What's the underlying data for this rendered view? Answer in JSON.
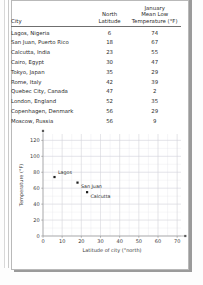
{
  "table": {
    "columns": [
      {
        "key": "city",
        "lines": [
          "City"
        ]
      },
      {
        "key": "lat",
        "lines": [
          "North",
          "Latitude"
        ]
      },
      {
        "key": "temp",
        "lines": [
          "January",
          "Mean Low",
          "Temperature (°F)"
        ]
      }
    ],
    "header": {
      "city": "City",
      "lat_line1": "North",
      "lat_line2": "Latitude",
      "temp_line1": "January",
      "temp_line2": "Mean Low",
      "temp_line3": "Temperature (°F)"
    },
    "rows": [
      {
        "city": "Lagos, Nigeria",
        "lat": "6",
        "temp": "74"
      },
      {
        "city": "San Juan, Puerto Rico",
        "lat": "18",
        "temp": "67"
      },
      {
        "city": "Calcutta, India",
        "lat": "23",
        "temp": "55"
      },
      {
        "city": "Cairo, Egypt",
        "lat": "30",
        "temp": "47"
      },
      {
        "city": "Tokyo, Japan",
        "lat": "35",
        "temp": "29"
      },
      {
        "city": "Rome, Italy",
        "lat": "42",
        "temp": "39"
      },
      {
        "city": "Quebec City, Canada",
        "lat": "47",
        "temp": "2"
      },
      {
        "city": "London, England",
        "lat": "52",
        "temp": "35"
      },
      {
        "city": "Copenhagen, Denmark",
        "lat": "56",
        "temp": "29"
      },
      {
        "city": "Moscow, Russia",
        "lat": "56",
        "temp": "9"
      }
    ]
  },
  "chart_data": {
    "type": "scatter",
    "title": "",
    "xlabel": "Latitude of city (°north)",
    "ylabel": "Temperature (°F)",
    "xlim": [
      0,
      72
    ],
    "ylim": [
      0,
      128
    ],
    "xticks": [
      0,
      10,
      20,
      30,
      40,
      50,
      60,
      70
    ],
    "yticks": [
      0,
      20,
      40,
      60,
      80,
      100,
      120
    ],
    "xtick_labels": [
      "0",
      "10",
      "20",
      "30",
      "40",
      "50",
      "60",
      "70"
    ],
    "ytick_labels": [
      "0",
      "20",
      "40",
      "60",
      "80",
      "100",
      "120"
    ],
    "grid": true,
    "grid_minor": true,
    "legend": "none",
    "points": [
      {
        "label": "Lagos",
        "x": 6,
        "y": 74,
        "label_pos": "above-right"
      },
      {
        "label": "San Juan",
        "x": 18,
        "y": 67,
        "label_pos": "below-right"
      },
      {
        "label": "Calcutta",
        "x": 23,
        "y": 55,
        "label_pos": "below-right"
      }
    ]
  }
}
